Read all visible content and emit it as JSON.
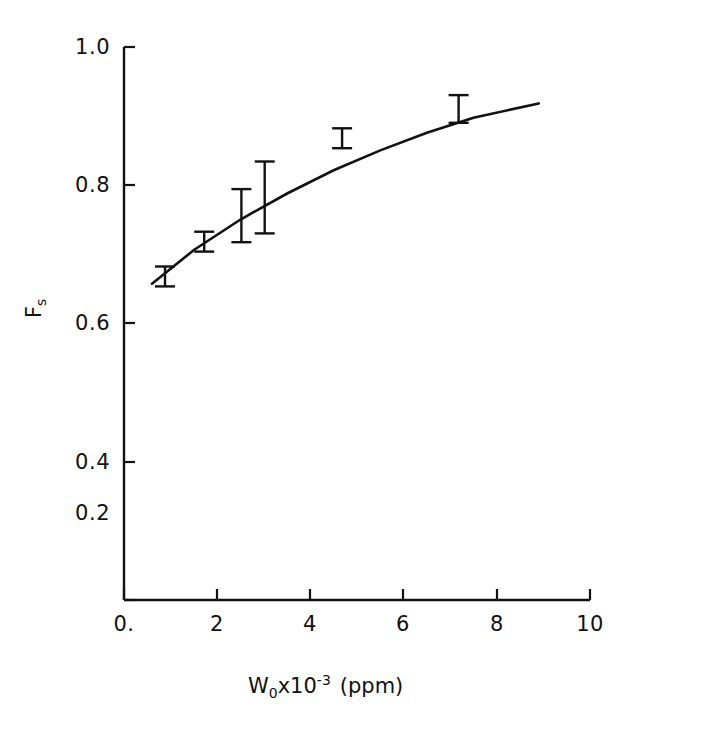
{
  "chart_data": {
    "type": "scatter",
    "title": "",
    "xlabel": "W0x10-3 (ppm)",
    "ylabel": "Fs",
    "xlim": [
      0,
      10
    ],
    "ylim": [
      0,
      1.0
    ],
    "grid": false,
    "legend": "none",
    "xticks": [
      "0.",
      "2",
      "4",
      "6",
      "8",
      "10"
    ],
    "xtick_values": [
      0,
      2,
      4,
      6,
      8,
      10
    ],
    "yticks": [
      "0.",
      "0.2",
      "0.4",
      "0.6",
      "0.8",
      "1.0"
    ],
    "ytick_values": [
      0,
      0.2,
      0.4,
      0.6,
      0.8,
      1.0
    ],
    "series": [
      {
        "name": "Fs measurements",
        "marker": "errorbar",
        "x": [
          0.88,
          1.72,
          2.52,
          3.02,
          4.68,
          7.18
        ],
        "y": [
          0.585,
          0.648,
          0.695,
          0.728,
          0.835,
          0.888
        ],
        "yerr_low": [
          0.018,
          0.018,
          0.048,
          0.065,
          0.018,
          0.025
        ],
        "yerr_high": [
          0.018,
          0.018,
          0.048,
          0.065,
          0.018,
          0.025
        ]
      },
      {
        "name": "fitted curve",
        "marker": "line",
        "x": [
          0.6,
          1.5,
          2.5,
          3.5,
          4.5,
          5.5,
          6.5,
          7.5,
          8.9
        ],
        "y": [
          0.572,
          0.633,
          0.688,
          0.735,
          0.777,
          0.813,
          0.845,
          0.872,
          0.898
        ]
      }
    ]
  },
  "axis_labels": {
    "y_symbol": "F",
    "y_subscript": "s",
    "x_symbol": "W",
    "x_subscript": "0",
    "x_times": "x10",
    "x_exponent": "-3",
    "x_units": "(ppm)"
  }
}
